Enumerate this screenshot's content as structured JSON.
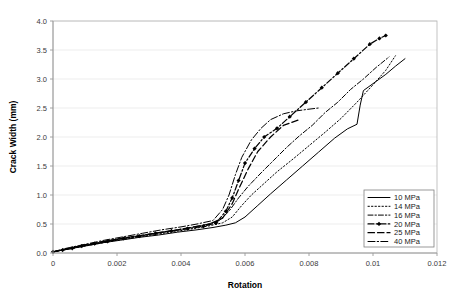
{
  "chart_data": {
    "type": "line",
    "title": "",
    "xlabel": "Rotation",
    "ylabel": "Crack Width (mm)",
    "xlim": [
      0,
      0.012
    ],
    "ylim": [
      0,
      4.0
    ],
    "xticks": [
      "0",
      "0.002",
      "0.004",
      "0.006",
      "0.008",
      "0.01",
      "0.012"
    ],
    "xtick_values": [
      0,
      0.002,
      0.004,
      0.006,
      0.008,
      0.01,
      0.012
    ],
    "yticks": [
      "0.0",
      "0.5",
      "1.0",
      "1.5",
      "2.0",
      "2.5",
      "3.0",
      "3.5",
      "4.0"
    ],
    "ytick_values": [
      0,
      0.5,
      1.0,
      1.5,
      2.0,
      2.5,
      3.0,
      3.5,
      4.0
    ],
    "grid": "horizontal",
    "legend_position": "bottom-right",
    "series": [
      {
        "name": "10 MPa",
        "style": "solid",
        "marker": "none",
        "x": [
          0,
          0.0003,
          0.0007,
          0.0011,
          0.0016,
          0.0021,
          0.0027,
          0.0033,
          0.0039,
          0.0045,
          0.005,
          0.0054,
          0.0057,
          0.006,
          0.0064,
          0.0068,
          0.0073,
          0.0078,
          0.0083,
          0.0088,
          0.0092,
          0.0095,
          0.0096,
          0.0097,
          0.0101,
          0.0104,
          0.0107,
          0.011
        ],
        "y": [
          0.02,
          0.05,
          0.09,
          0.13,
          0.18,
          0.22,
          0.27,
          0.31,
          0.36,
          0.4,
          0.44,
          0.48,
          0.52,
          0.62,
          0.82,
          1.02,
          1.26,
          1.5,
          1.74,
          1.98,
          2.14,
          2.22,
          2.55,
          2.8,
          2.96,
          3.08,
          3.22,
          3.35
        ]
      },
      {
        "name": "14 MPa",
        "style": "dotted",
        "marker": "none",
        "x": [
          0,
          0.0004,
          0.0009,
          0.0014,
          0.002,
          0.0026,
          0.0032,
          0.0038,
          0.0044,
          0.0049,
          0.0053,
          0.0056,
          0.0059,
          0.0062,
          0.0066,
          0.007,
          0.0075,
          0.008,
          0.0085,
          0.009,
          0.0095,
          0.01,
          0.0104,
          0.0107
        ],
        "y": [
          0.02,
          0.06,
          0.11,
          0.16,
          0.22,
          0.27,
          0.32,
          0.37,
          0.42,
          0.47,
          0.52,
          0.62,
          0.82,
          1.0,
          1.2,
          1.4,
          1.62,
          1.85,
          2.08,
          2.32,
          2.6,
          2.9,
          3.15,
          3.4
        ]
      },
      {
        "name": "16 MPa",
        "style": "dashdot",
        "marker": "none",
        "x": [
          0,
          0.0004,
          0.0009,
          0.0014,
          0.002,
          0.0026,
          0.0032,
          0.0038,
          0.0043,
          0.0048,
          0.0052,
          0.0055,
          0.0058,
          0.0061,
          0.0065,
          0.0069,
          0.0073,
          0.0077,
          0.0081,
          0.0085,
          0.0089,
          0.0093,
          0.0097,
          0.0101,
          0.0105
        ],
        "y": [
          0.02,
          0.07,
          0.12,
          0.18,
          0.24,
          0.29,
          0.34,
          0.39,
          0.44,
          0.49,
          0.56,
          0.72,
          0.95,
          1.15,
          1.38,
          1.6,
          1.82,
          2.02,
          2.2,
          2.42,
          2.6,
          2.82,
          3.0,
          3.2,
          3.38
        ]
      },
      {
        "name": "20 MPa",
        "style": "dashdot-marker",
        "marker": "diamond",
        "x": [
          0,
          0.0003,
          0.0006,
          0.0009,
          0.0013,
          0.0017,
          0.0022,
          0.0027,
          0.0032,
          0.0037,
          0.0042,
          0.0047,
          0.0051,
          0.0054,
          0.0056,
          0.0058,
          0.006,
          0.0063,
          0.0066,
          0.007,
          0.0074,
          0.0079,
          0.0084,
          0.0089,
          0.0094,
          0.0099,
          0.0102,
          0.0104
        ],
        "y": [
          0.02,
          0.05,
          0.08,
          0.12,
          0.16,
          0.2,
          0.25,
          0.29,
          0.34,
          0.38,
          0.42,
          0.46,
          0.52,
          0.72,
          0.95,
          1.25,
          1.55,
          1.8,
          2.0,
          2.15,
          2.35,
          2.6,
          2.85,
          3.1,
          3.35,
          3.6,
          3.7,
          3.75
        ]
      },
      {
        "name": "25 MPa",
        "style": "dashed",
        "marker": "none",
        "x": [
          0,
          0.0004,
          0.0009,
          0.0015,
          0.0021,
          0.0027,
          0.0033,
          0.0039,
          0.0044,
          0.0049,
          0.0053,
          0.0056,
          0.0058,
          0.0061,
          0.0064,
          0.0068,
          0.0072,
          0.0077
        ],
        "y": [
          0.02,
          0.07,
          0.13,
          0.19,
          0.25,
          0.3,
          0.35,
          0.4,
          0.45,
          0.5,
          0.6,
          0.85,
          1.1,
          1.45,
          1.75,
          2.0,
          2.2,
          2.3
        ]
      },
      {
        "name": "40 MPa",
        "style": "longdashdot",
        "marker": "none",
        "x": [
          0,
          0.0004,
          0.001,
          0.0016,
          0.0022,
          0.0028,
          0.0034,
          0.004,
          0.0045,
          0.005,
          0.0053,
          0.0055,
          0.0057,
          0.0059,
          0.0062,
          0.0065,
          0.0068,
          0.0072,
          0.0076,
          0.008,
          0.0083
        ],
        "y": [
          0.02,
          0.08,
          0.15,
          0.22,
          0.28,
          0.34,
          0.4,
          0.45,
          0.5,
          0.56,
          0.75,
          1.0,
          1.35,
          1.65,
          1.95,
          2.15,
          2.3,
          2.4,
          2.45,
          2.48,
          2.5
        ]
      }
    ]
  },
  "legend": {
    "items": [
      {
        "label": "10 MPa"
      },
      {
        "label": "14 MPa"
      },
      {
        "label": "16 MPa"
      },
      {
        "label": "20 MPa"
      },
      {
        "label": "25 MPa"
      },
      {
        "label": "40 MPa"
      }
    ]
  },
  "colors": {
    "line": "#000000",
    "grid": "#e8e8e8",
    "frame": "#b5b5b5",
    "text": "#1a1a1a",
    "background": "#ffffff"
  }
}
